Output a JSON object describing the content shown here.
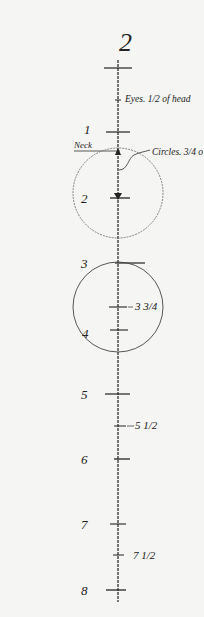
{
  "figure": {
    "title": "2",
    "annotations": {
      "eyes": "Eyes. 1/2 of head",
      "neck": "Neck",
      "circles": "Circles. 3/4 o"
    },
    "scale_labels": [
      {
        "label": "1",
        "y": 132
      },
      {
        "label": "2",
        "y": 198
      },
      {
        "label": "3",
        "y": 263
      },
      {
        "label": "3 3/4",
        "y": 307
      },
      {
        "label": "4",
        "y": 330
      },
      {
        "label": "5",
        "y": 394
      },
      {
        "label": "5 1/2",
        "y": 426
      },
      {
        "label": "6",
        "y": 459
      },
      {
        "label": "7",
        "y": 524
      },
      {
        "label": "7 1/2",
        "y": 555
      },
      {
        "label": "8",
        "y": 590
      }
    ],
    "colors": {
      "paper": "#f5f5f3",
      "ink": "#222222"
    }
  }
}
